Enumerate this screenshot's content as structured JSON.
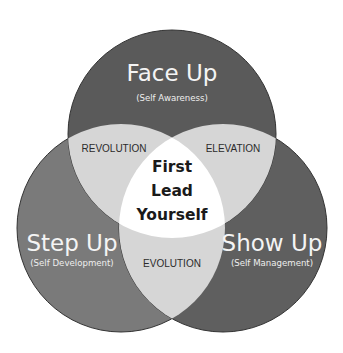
{
  "diagram": {
    "type": "venn-3",
    "circles": [
      {
        "id": "top",
        "title": "Face Up",
        "subtitle": "(Self Awareness)",
        "color": "#5a5a5a"
      },
      {
        "id": "left",
        "title": "Step Up",
        "subtitle": "(Self Development)",
        "color": "#7a7a7a"
      },
      {
        "id": "right",
        "title": "Show Up",
        "subtitle": "(Self Management)",
        "color": "#5f5f5f"
      }
    ],
    "overlaps": {
      "top_left": "REVOLUTION",
      "top_right": "ELEVATION",
      "left_right": "EVOLUTION",
      "pair_color": "#d6d6d6"
    },
    "center": {
      "lines": [
        "First",
        "Lead",
        "Yourself"
      ],
      "color": "#ffffff"
    }
  }
}
